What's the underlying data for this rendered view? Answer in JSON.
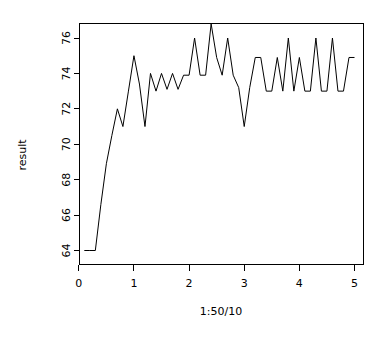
{
  "chart_data": {
    "type": "line",
    "title": "",
    "subtitle": "",
    "xlabel": "1:50/10",
    "ylabel": "result",
    "grid": false,
    "legend": null,
    "x": [
      0.1,
      0.2,
      0.3,
      0.4,
      0.5,
      0.6,
      0.7,
      0.8,
      0.9,
      1.0,
      1.1,
      1.2,
      1.3,
      1.4,
      1.5,
      1.6,
      1.7,
      1.8,
      1.9,
      2.0,
      2.1,
      2.2,
      2.3,
      2.4,
      2.5,
      2.6,
      2.7,
      2.8,
      2.9,
      3.0,
      3.1,
      3.2,
      3.3,
      3.4,
      3.5,
      3.6,
      3.7,
      3.8,
      3.9,
      4.0,
      4.1,
      4.2,
      4.3,
      4.4,
      4.5,
      4.6,
      4.7,
      4.8,
      4.9,
      5.0
    ],
    "values": [
      64,
      64,
      64,
      66.6,
      68.9,
      70.5,
      72,
      71,
      73,
      75,
      73.4,
      71,
      74,
      73,
      74,
      73.1,
      74,
      73.1,
      73.9,
      73.9,
      76,
      73.9,
      73.9,
      76.8,
      74.9,
      73.9,
      76,
      73.9,
      73.2,
      71,
      73.2,
      74.9,
      74.9,
      73,
      73,
      74.9,
      73,
      76,
      73,
      74.9,
      73,
      73,
      76,
      73,
      73,
      76,
      73,
      73,
      74.9,
      74.9
    ],
    "xlim": [
      0.1,
      5.0
    ],
    "ylim": [
      64,
      76.8
    ],
    "xticks": [
      0,
      1,
      2,
      3,
      4,
      5
    ],
    "xtick_labels": [
      "0",
      "1",
      "2",
      "3",
      "4",
      "5"
    ],
    "yticks": [
      64,
      66,
      68,
      70,
      72,
      74,
      76
    ],
    "ytick_labels": [
      "64",
      "66",
      "68",
      "70",
      "72",
      "74",
      "76"
    ],
    "line_color": "#000000",
    "background_color": "#ffffff",
    "axis_color": "#000000"
  }
}
